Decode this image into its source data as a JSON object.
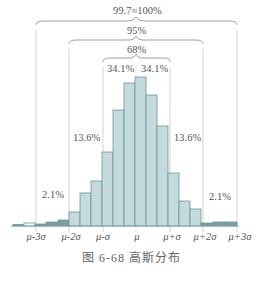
{
  "chart_data": {
    "type": "bar",
    "title": "图 6-68 高斯分布",
    "xlabel": "",
    "ylabel": "",
    "x_tick_labels": [
      "μ-3σ",
      "μ-2σ",
      "μ-σ",
      "μ",
      "μ+σ",
      "μ+2σ",
      "μ+3σ"
    ],
    "bars": [
      {
        "x_start": 13,
        "x_end": 24,
        "height": 1.5
      },
      {
        "x_start": 24,
        "x_end": 35,
        "height": 3
      },
      {
        "x_start": 35,
        "x_end": 46,
        "height": 2
      },
      {
        "x_start": 46,
        "x_end": 58,
        "height": 4
      },
      {
        "x_start": 58,
        "x_end": 69,
        "height": 6
      },
      {
        "x_start": 69,
        "x_end": 80,
        "height": 14
      },
      {
        "x_start": 80,
        "x_end": 91,
        "height": 33
      },
      {
        "x_start": 91,
        "x_end": 102,
        "height": 45
      },
      {
        "x_start": 102,
        "x_end": 113,
        "height": 74
      },
      {
        "x_start": 113,
        "x_end": 124,
        "height": 116
      },
      {
        "x_start": 124,
        "x_end": 135,
        "height": 143
      },
      {
        "x_start": 135,
        "x_end": 146,
        "height": 149
      },
      {
        "x_start": 146,
        "x_end": 157,
        "height": 131
      },
      {
        "x_start": 157,
        "x_end": 168,
        "height": 100
      },
      {
        "x_start": 168,
        "x_end": 179,
        "height": 53
      },
      {
        "x_start": 179,
        "x_end": 190,
        "height": 25
      },
      {
        "x_start": 190,
        "x_end": 201,
        "height": 17
      },
      {
        "x_start": 201,
        "x_end": 213,
        "height": 3
      },
      {
        "x_start": 213,
        "x_end": 225,
        "height": 4
      },
      {
        "x_start": 225,
        "x_end": 237,
        "height": 4
      }
    ],
    "annotations": [
      {
        "label": "99.7≈100%",
        "range": [
          "μ-3σ",
          "μ+3σ"
        ]
      },
      {
        "label": "95%",
        "range": [
          "μ-2σ",
          "μ+2σ"
        ]
      },
      {
        "label": "68%",
        "range": [
          "μ-σ",
          "μ+σ"
        ]
      },
      {
        "label": "34.1%",
        "range": [
          "μ-σ",
          "μ"
        ]
      },
      {
        "label": "34.1%",
        "range": [
          "μ",
          "μ+σ"
        ]
      },
      {
        "label": "13.6%",
        "range": [
          "μ-2σ",
          "μ-σ"
        ]
      },
      {
        "label": "13.6%",
        "range": [
          "μ+σ",
          "μ+2σ"
        ]
      },
      {
        "label": "2.1%",
        "range": [
          "μ-3σ",
          "μ-2σ"
        ]
      },
      {
        "label": "2.1%",
        "range": [
          "μ+2σ",
          "μ+3σ"
        ]
      }
    ],
    "grid": false,
    "legend": "none"
  },
  "labels": {
    "p997": "99.7≈100%",
    "p95": "95%",
    "p68": "68%",
    "p341_left": "34.1%",
    "p341_right": "34.1%",
    "p136_left": "13.6%",
    "p136_right": "13.6%",
    "p21_left": "2.1%",
    "p21_right": "2.1%"
  },
  "ticks": [
    "μ-3σ",
    "μ-2σ",
    "μ-σ",
    "μ",
    "μ+σ",
    "μ+2σ",
    "μ+3σ"
  ],
  "caption": "图 6-68   高斯分布"
}
